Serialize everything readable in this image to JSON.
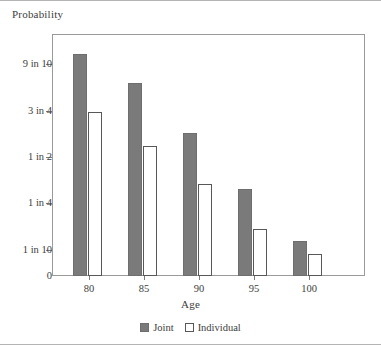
{
  "figure": {
    "width": 381,
    "height": 351,
    "background": "#ffffff",
    "frame_color": "#9a9a9a",
    "rule_color": "#b4b4b4"
  },
  "chart_data": {
    "type": "bar",
    "title": "",
    "ylabel": "Probability",
    "xlabel": "Age",
    "categories": [
      "80",
      "85",
      "90",
      "95",
      "100"
    ],
    "series": [
      {
        "name": "Joint",
        "color": "#7a7a7a",
        "values": [
          0.93,
          0.85,
          0.63,
          0.3,
          0.13
        ],
        "value_labels": [
          "9 in 10",
          "",
          "",
          "",
          ""
        ]
      },
      {
        "name": "Individual",
        "color": "#ffffff",
        "values": [
          0.74,
          0.55,
          0.33,
          0.17,
          0.08
        ],
        "value_labels": [
          "3 in 4",
          "",
          "",
          "",
          ""
        ]
      }
    ],
    "ytick_labels": [
      "9 in 10",
      "3 in 4",
      "1 in 2",
      "1 in 4",
      "1 in 10",
      "0"
    ],
    "ytick_values": [
      0.9,
      0.75,
      0.5,
      0.25,
      0.1,
      0.0
    ],
    "ytick_pixels": [
      64,
      111,
      157,
      203,
      250,
      276
    ],
    "xtick_pixels": [
      89,
      144,
      199,
      254,
      309
    ],
    "grid": false,
    "legend_position": "bottom-center",
    "legend_entries": [
      "Joint",
      "Individual"
    ],
    "bar_geometry": {
      "joint_tops": [
        54,
        83,
        133,
        189,
        241
      ],
      "individual_tops": [
        112,
        146,
        184,
        229,
        254
      ],
      "baseline": 276,
      "bar_width": 14,
      "joint_lefts": [
        73,
        128,
        183,
        238,
        293
      ],
      "individual_lefts": [
        88,
        143,
        198,
        253,
        308
      ]
    }
  }
}
